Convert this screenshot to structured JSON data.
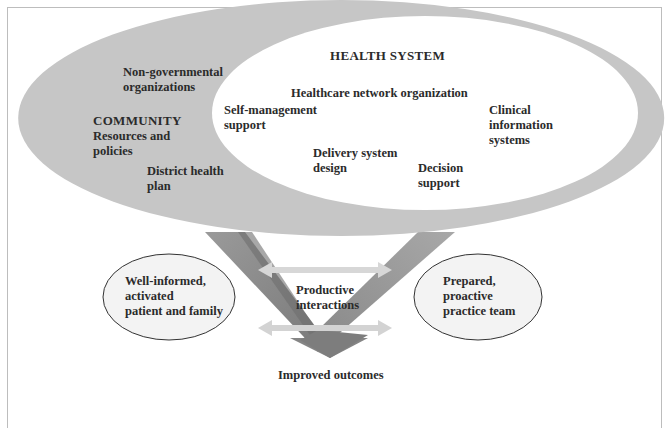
{
  "diagram": {
    "health_system": {
      "title": "HEALTH SYSTEM",
      "items": [
        "Healthcare network organization",
        "Self-management\nsupport",
        "Clinical\ninformation\nsystems",
        "Delivery system\ndesign",
        "Decision\nsupport"
      ]
    },
    "community": {
      "title": "COMMUNITY",
      "items": [
        "Non-governmental\norganizations",
        "Resources and\npolicies",
        "District health\nplan"
      ]
    },
    "patient": "Well-informed,\nactivated\npatient and family",
    "team": "Prepared,\nproactive\npractice team",
    "interactions": "Productive\ninteractions",
    "outcome": "Improved outcomes",
    "colors": {
      "outer_ellipse": "#c9c9c9",
      "inner_ellipse": "#ffffff",
      "v_left": "#8a8a8a",
      "v_right": "#9a9a9a",
      "arrow": "#d6d6d6",
      "side_ellipse": "#f4f4f4"
    }
  }
}
